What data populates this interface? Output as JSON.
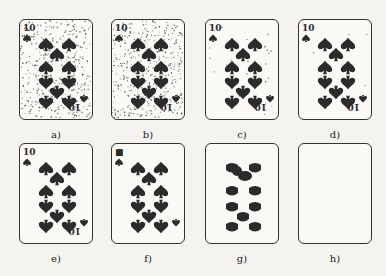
{
  "figure": {
    "panels": [
      {
        "label": "a)",
        "noise": "heavy",
        "symbols": "spades",
        "index": true
      },
      {
        "label": "b)",
        "noise": "heavy",
        "symbols": "spades",
        "index": true
      },
      {
        "label": "c)",
        "noise": "light",
        "symbols": "spades",
        "index": true
      },
      {
        "label": "d)",
        "noise": "minimal",
        "symbols": "spades",
        "index": true
      },
      {
        "label": "e)",
        "noise": "none",
        "symbols": "spades",
        "index": true
      },
      {
        "label": "f)",
        "noise": "none",
        "symbols": "spades-rounded",
        "index": true
      },
      {
        "label": "g)",
        "noise": "none",
        "symbols": "blobs",
        "index": false
      },
      {
        "label": "h)",
        "noise": "none",
        "symbols": "empty",
        "index": false
      }
    ]
  },
  "colors": {
    "ink": "#2b2b2b",
    "background": "#f4f3f0",
    "card": "#faf9f6"
  }
}
